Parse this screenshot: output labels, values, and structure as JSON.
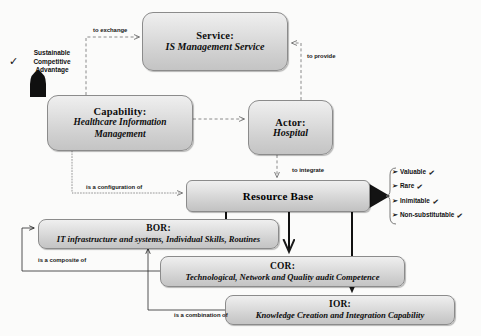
{
  "diagram": {
    "nodes": {
      "service": {
        "title": "Service:",
        "subtitle": "IS Management Service"
      },
      "capability": {
        "title": "Capability:",
        "subtitle": "Healthcare Information Management"
      },
      "actor": {
        "title": "Actor:",
        "subtitle": "Hospital"
      },
      "resource_base": {
        "title": "Resource Base"
      },
      "bor": {
        "title": "BOR:",
        "subtitle": "IT infrastructure and systems, Individual Skills, Routines"
      },
      "cor": {
        "title": "COR:",
        "subtitle": "Technological, Network and  Quality audit Competence"
      },
      "ior": {
        "title": "IOR:",
        "subtitle": "Knowledge Creation and Integration Capability"
      }
    },
    "edge_labels": {
      "to_exchange": "to exchange",
      "to_provide": "to provide",
      "to_integrate": "to integrate",
      "is_a_configuration_of": "is a configuration  of",
      "is_a_composite_of": "is a composite of",
      "is_a_combination_of": "is a combination  of"
    },
    "outcome": {
      "sustainable_advantage": [
        "Sustainable",
        "Competitive",
        "Advantage"
      ],
      "check_glyph": "✓",
      "bullet_glyph": "➢",
      "vrin": [
        "Valuable",
        "Rare",
        "Inimitable",
        "Non-substitutable"
      ]
    },
    "colors": {
      "node_fill_light": "#efefef",
      "node_fill_dark": "#c4c4c4",
      "node_border": "#8b8b8b",
      "connector_solid": "#111111",
      "connector_dashed": "#8a8a8a",
      "background": "#fbfbfa"
    }
  }
}
